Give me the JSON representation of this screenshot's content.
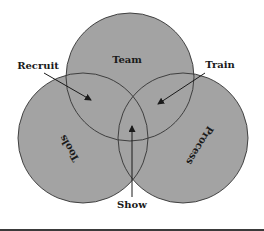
{
  "diagram": {
    "type": "venn",
    "colors": {
      "background": "#ffffff",
      "circle_fill": "#a3a3a3",
      "circle_stroke": "#333333",
      "text": "#1a1a1a",
      "arrow": "#1a1a1a"
    },
    "circles": [
      {
        "label": "Team"
      },
      {
        "label": "Tools"
      },
      {
        "label": "Process"
      }
    ],
    "callouts": [
      {
        "label": "Recruit",
        "points_to": "Team ∩ Tools"
      },
      {
        "label": "Train",
        "points_to": "Team ∩ Process"
      },
      {
        "label": "Show",
        "points_to": "Team ∩ Tools ∩ Process"
      }
    ]
  }
}
